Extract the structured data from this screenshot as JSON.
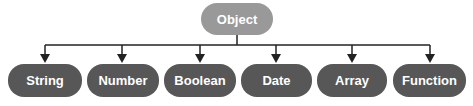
{
  "diagram": {
    "type": "tree",
    "root": {
      "label": "Object",
      "x": 201,
      "y": 3,
      "w": 72,
      "h": 32
    },
    "children": [
      {
        "label": "String",
        "x": 8,
        "y": 64,
        "w": 74,
        "h": 33,
        "arrow_x": 45
      },
      {
        "label": "Number",
        "x": 87,
        "y": 64,
        "w": 72,
        "h": 33,
        "arrow_x": 122
      },
      {
        "label": "Boolean",
        "x": 164,
        "y": 64,
        "w": 72,
        "h": 33,
        "arrow_x": 200
      },
      {
        "label": "Date",
        "x": 241,
        "y": 64,
        "w": 71,
        "h": 33,
        "arrow_x": 276
      },
      {
        "label": "Array",
        "x": 317,
        "y": 64,
        "w": 70,
        "h": 33,
        "arrow_x": 352
      },
      {
        "label": "Function",
        "x": 393,
        "y": 64,
        "w": 73,
        "h": 33,
        "arrow_x": 430
      }
    ],
    "edges": [
      "Object->String",
      "Object->Number",
      "Object->Boolean",
      "Object->Date",
      "Object->Array",
      "Object->Function"
    ],
    "colors": {
      "root_fill": "#999999",
      "child_fill": "#575757",
      "text": "#ffffff",
      "line": "#222222"
    }
  }
}
